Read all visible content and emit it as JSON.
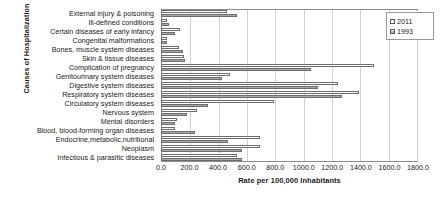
{
  "chart_data": {
    "type": "bar",
    "orientation": "horizontal",
    "title": "",
    "xlabel": "Rate per 100,000 Inhabitants",
    "ylabel": "Causes of Hospitalization",
    "xlim": [
      0,
      1800
    ],
    "xticks": [
      "0.0",
      "200.0",
      "400.0",
      "600.0",
      "800.0",
      "1000.0",
      "1200.0",
      "1400.0",
      "1600.0",
      "1800.0"
    ],
    "xtick_values": [
      0,
      200,
      400,
      600,
      800,
      1000,
      1200,
      1400,
      1600,
      1800
    ],
    "grid": true,
    "legend_position": "top-right",
    "categories": [
      "External injury & poisoning",
      "Ill-defined conditions",
      "Certain diseases of early infancy",
      "Congenital malformations",
      "Bones, muscle system diseases",
      "Skin & tissue diseases",
      "Complication of pregnancy",
      "Genitourinary system diseases",
      "Digestive system diseases",
      "Respiratory system diseases",
      "Circulatory system diseases",
      "Nervous system",
      "Mental disorders",
      "Blood, blood-forming organ diseases",
      "Endocrine,metabolic,nutritional",
      "Neoplasm",
      "Infectious & parasitic diseases"
    ],
    "series": [
      {
        "name": "2011",
        "values": [
          460,
          40,
          130,
          40,
          125,
          160,
          1490,
          480,
          1240,
          1390,
          790,
          250,
          110,
          100,
          690,
          690,
          530
        ]
      },
      {
        "name": "1993",
        "values": [
          530,
          55,
          100,
          45,
          155,
          170,
          1050,
          430,
          1100,
          1270,
          330,
          180,
          100,
          240,
          470,
          570,
          570
        ]
      }
    ]
  },
  "legend": {
    "items": [
      {
        "label": "2011",
        "key": "y2011"
      },
      {
        "label": "1993",
        "key": "y1993"
      }
    ]
  }
}
